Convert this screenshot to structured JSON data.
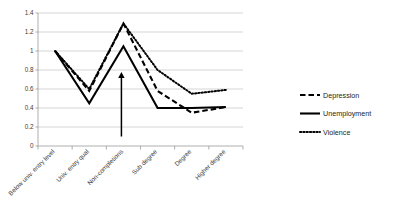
{
  "chart_data": {
    "type": "line",
    "title": "",
    "subtitle": "",
    "xlabel": "",
    "ylabel": "",
    "ylim": [
      0,
      1.4
    ],
    "ytick_values": [
      0,
      0.2,
      0.4,
      0.6,
      0.8,
      1,
      1.2,
      1.4
    ],
    "ytick_labels": [
      "0",
      "0.2",
      "0.4",
      "0.6",
      "0.8",
      "1",
      "1.2",
      "1.4"
    ],
    "grid": true,
    "legend_position": "right",
    "categories": [
      "Below univ. entry level",
      "Univ. entry qual",
      "Non-completions",
      "Sub degree",
      "Degree",
      "Higher degree"
    ],
    "series": [
      {
        "name": "Depression",
        "style": "dashed",
        "color": "#000000",
        "values": [
          1.0,
          0.58,
          1.29,
          0.58,
          0.35,
          0.41
        ]
      },
      {
        "name": "Unemployment",
        "style": "solid",
        "color": "#000000",
        "values": [
          1.0,
          0.45,
          1.05,
          0.4,
          0.4,
          0.41
        ]
      },
      {
        "name": "Violence",
        "style": "dotted",
        "color": "#000000",
        "values": [
          1.0,
          0.6,
          1.29,
          0.8,
          0.55,
          0.59
        ]
      }
    ],
    "annotations": [
      {
        "type": "arrow",
        "name": "non-completions-arrow",
        "direction": "up",
        "at_category": "Non-completions",
        "y_start": 0.1,
        "y_end": 0.78
      }
    ]
  },
  "legend": {
    "items": [
      {
        "label": "Depression",
        "style": "dashed"
      },
      {
        "label": "Unemployment",
        "style": "solid"
      },
      {
        "label": "Violence",
        "style": "dotted"
      }
    ]
  }
}
